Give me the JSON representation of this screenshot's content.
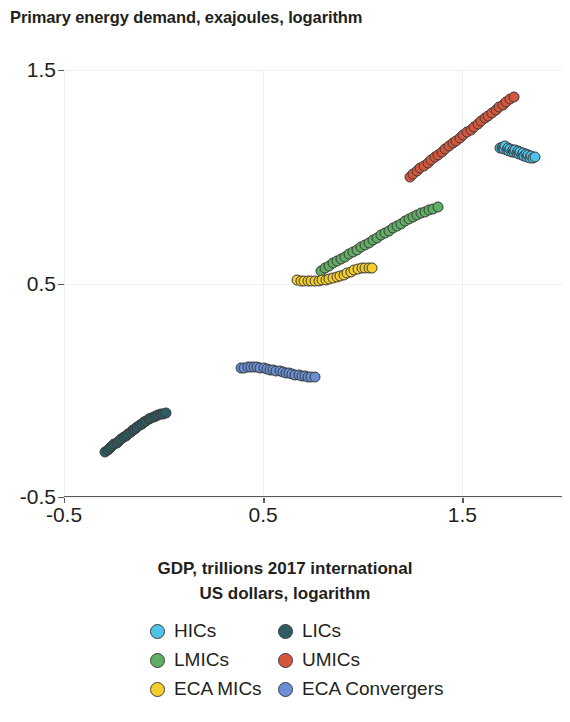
{
  "chart_data": {
    "type": "scatter",
    "title": "Primary energy demand, exajoules, logarithm",
    "xlabel": "GDP, trillions 2017 international US dollars, logarithm",
    "ylabel": "Primary energy demand, exajoules, logarithm",
    "xlim": [
      -0.5,
      2.0
    ],
    "ylim": [
      -0.5,
      1.5
    ],
    "xticks": [
      -0.5,
      0.5,
      1.5
    ],
    "xtick_labels": [
      "-0.5",
      "0.5",
      "1.5"
    ],
    "yticks": [
      -0.5,
      0.5,
      1.5
    ],
    "ytick_labels": [
      "-0.5",
      "0.5",
      "1.5"
    ],
    "grid": true,
    "legend_position": "bottom",
    "colors": {
      "HICs": "#4FC3E8",
      "LICs": "#2E5C63",
      "LMICs": "#5FAE63",
      "UMICs": "#D4563C",
      "ECA MICs": "#F5CE2A",
      "ECA Convergers": "#6A8FD4"
    },
    "series": [
      {
        "name": "HICs",
        "color": "#4FC3E8",
        "points": [
          [
            1.69,
            1.137
          ],
          [
            1.697,
            1.133
          ],
          [
            1.703,
            1.14
          ],
          [
            1.71,
            1.13
          ],
          [
            1.716,
            1.144
          ],
          [
            1.722,
            1.126
          ],
          [
            1.728,
            1.136
          ],
          [
            1.735,
            1.122
          ],
          [
            1.741,
            1.131
          ],
          [
            1.747,
            1.118
          ],
          [
            1.754,
            1.127
          ],
          [
            1.76,
            1.114
          ],
          [
            1.766,
            1.123
          ],
          [
            1.772,
            1.11
          ],
          [
            1.779,
            1.119
          ],
          [
            1.785,
            1.106
          ],
          [
            1.791,
            1.115
          ],
          [
            1.798,
            1.102
          ],
          [
            1.804,
            1.11
          ],
          [
            1.81,
            1.098
          ],
          [
            1.817,
            1.105
          ],
          [
            1.823,
            1.094
          ],
          [
            1.83,
            1.1
          ],
          [
            1.838,
            1.09
          ],
          [
            1.846,
            1.096
          ],
          [
            1.854,
            1.086
          ],
          [
            1.862,
            1.092
          ]
        ]
      },
      {
        "name": "LICs",
        "color": "#2E5C63",
        "points": [
          [
            -0.293,
            -0.288
          ],
          [
            -0.281,
            -0.279
          ],
          [
            -0.27,
            -0.271
          ],
          [
            -0.258,
            -0.263
          ],
          [
            -0.247,
            -0.254
          ],
          [
            -0.235,
            -0.246
          ],
          [
            -0.224,
            -0.238
          ],
          [
            -0.212,
            -0.229
          ],
          [
            -0.201,
            -0.221
          ],
          [
            -0.189,
            -0.213
          ],
          [
            -0.178,
            -0.204
          ],
          [
            -0.166,
            -0.196
          ],
          [
            -0.155,
            -0.188
          ],
          [
            -0.143,
            -0.18
          ],
          [
            -0.132,
            -0.172
          ],
          [
            -0.12,
            -0.164
          ],
          [
            -0.109,
            -0.157
          ],
          [
            -0.097,
            -0.15
          ],
          [
            -0.086,
            -0.143
          ],
          [
            -0.074,
            -0.137
          ],
          [
            -0.062,
            -0.131
          ],
          [
            -0.05,
            -0.126
          ],
          [
            -0.038,
            -0.121
          ],
          [
            -0.026,
            -0.117
          ],
          [
            -0.014,
            -0.113
          ],
          [
            -0.002,
            -0.11
          ],
          [
            0.01,
            -0.108
          ]
        ]
      },
      {
        "name": "LMICs",
        "color": "#5FAE63",
        "points": [
          [
            0.79,
            0.56
          ],
          [
            0.81,
            0.572
          ],
          [
            0.83,
            0.583
          ],
          [
            0.85,
            0.594
          ],
          [
            0.87,
            0.604
          ],
          [
            0.89,
            0.615
          ],
          [
            0.91,
            0.626
          ],
          [
            0.93,
            0.637
          ],
          [
            0.95,
            0.648
          ],
          [
            0.97,
            0.659
          ],
          [
            0.99,
            0.67
          ],
          [
            1.01,
            0.681
          ],
          [
            1.03,
            0.692
          ],
          [
            1.05,
            0.703
          ],
          [
            1.07,
            0.714
          ],
          [
            1.09,
            0.726
          ],
          [
            1.11,
            0.737
          ],
          [
            1.13,
            0.748
          ],
          [
            1.15,
            0.759
          ],
          [
            1.17,
            0.77
          ],
          [
            1.19,
            0.781
          ],
          [
            1.21,
            0.791
          ],
          [
            1.23,
            0.801
          ],
          [
            1.25,
            0.811
          ],
          [
            1.27,
            0.82
          ],
          [
            1.29,
            0.828
          ],
          [
            1.31,
            0.836
          ],
          [
            1.33,
            0.843
          ],
          [
            1.352,
            0.851
          ],
          [
            1.375,
            0.858
          ]
        ]
      },
      {
        "name": "UMICs",
        "color": "#D4563C",
        "points": [
          [
            1.235,
            1.0
          ],
          [
            1.253,
            1.013
          ],
          [
            1.271,
            1.026
          ],
          [
            1.289,
            1.039
          ],
          [
            1.307,
            1.052
          ],
          [
            1.325,
            1.065
          ],
          [
            1.343,
            1.078
          ],
          [
            1.361,
            1.091
          ],
          [
            1.379,
            1.104
          ],
          [
            1.397,
            1.117
          ],
          [
            1.415,
            1.13
          ],
          [
            1.433,
            1.143
          ],
          [
            1.451,
            1.156
          ],
          [
            1.469,
            1.169
          ],
          [
            1.487,
            1.182
          ],
          [
            1.505,
            1.195
          ],
          [
            1.523,
            1.208
          ],
          [
            1.541,
            1.221
          ],
          [
            1.559,
            1.234
          ],
          [
            1.577,
            1.247
          ],
          [
            1.595,
            1.26
          ],
          [
            1.613,
            1.273
          ],
          [
            1.631,
            1.286
          ],
          [
            1.649,
            1.299
          ],
          [
            1.667,
            1.312
          ],
          [
            1.685,
            1.325
          ],
          [
            1.703,
            1.338
          ],
          [
            1.721,
            1.351
          ],
          [
            1.739,
            1.363
          ],
          [
            1.757,
            1.374
          ]
        ]
      },
      {
        "name": "ECA MICs",
        "color": "#F5CE2A",
        "points": [
          [
            0.67,
            0.516
          ],
          [
            0.688,
            0.514
          ],
          [
            0.706,
            0.513
          ],
          [
            0.724,
            0.512
          ],
          [
            0.742,
            0.512
          ],
          [
            0.76,
            0.513
          ],
          [
            0.778,
            0.514
          ],
          [
            0.796,
            0.516
          ],
          [
            0.814,
            0.518
          ],
          [
            0.832,
            0.521
          ],
          [
            0.85,
            0.525
          ],
          [
            0.868,
            0.53
          ],
          [
            0.886,
            0.536
          ],
          [
            0.904,
            0.542
          ],
          [
            0.922,
            0.549
          ],
          [
            0.94,
            0.556
          ],
          [
            0.958,
            0.562
          ],
          [
            0.976,
            0.567
          ],
          [
            0.994,
            0.571
          ],
          [
            1.012,
            0.573
          ],
          [
            1.03,
            0.574
          ],
          [
            1.048,
            0.574
          ]
        ]
      },
      {
        "name": "ECA Convergers",
        "color": "#6A8FD4",
        "points": [
          [
            0.39,
            0.103
          ],
          [
            0.406,
            0.106
          ],
          [
            0.422,
            0.108
          ],
          [
            0.438,
            0.109
          ],
          [
            0.454,
            0.109
          ],
          [
            0.47,
            0.108
          ],
          [
            0.486,
            0.106
          ],
          [
            0.502,
            0.103
          ],
          [
            0.518,
            0.1
          ],
          [
            0.534,
            0.097
          ],
          [
            0.55,
            0.094
          ],
          [
            0.566,
            0.091
          ],
          [
            0.582,
            0.088
          ],
          [
            0.598,
            0.085
          ],
          [
            0.614,
            0.082
          ],
          [
            0.63,
            0.079
          ],
          [
            0.646,
            0.076
          ],
          [
            0.662,
            0.073
          ],
          [
            0.678,
            0.07
          ],
          [
            0.694,
            0.068
          ],
          [
            0.71,
            0.066
          ],
          [
            0.726,
            0.064
          ],
          [
            0.742,
            0.063
          ],
          [
            0.758,
            0.062
          ]
        ]
      }
    ]
  },
  "legend": {
    "items": [
      {
        "label": "HICs",
        "color": "#4FC3E8"
      },
      {
        "label": "LICs",
        "color": "#2E5C63"
      },
      {
        "label": "LMICs",
        "color": "#5FAE63"
      },
      {
        "label": "UMICs",
        "color": "#D4563C"
      },
      {
        "label": "ECA MICs",
        "color": "#F5CE2A"
      },
      {
        "label": "ECA Convergers",
        "color": "#6A8FD4"
      }
    ]
  },
  "axis_caption": {
    "line1": "GDP, trillions 2017 international",
    "line2": "US dollars, logarithm"
  }
}
